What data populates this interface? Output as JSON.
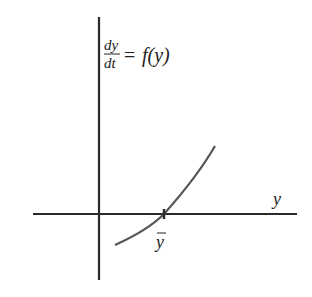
{
  "diagram": {
    "equation": {
      "numerator": "dy",
      "denominator": "dt",
      "equals": "=",
      "rhs": "f(y)"
    },
    "x_axis_label": "y",
    "equilibrium_label": "y",
    "equilibrium_bar": "‾",
    "colors": {
      "axes": "#2a2a2a",
      "curve": "#555555",
      "text": "#222222"
    }
  }
}
